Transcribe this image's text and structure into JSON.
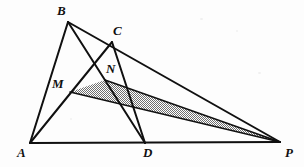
{
  "figure": {
    "kind": "geometry-diagram",
    "background_color": "#fdfdfd",
    "stroke_color": "#101010",
    "shade_fill_color": "#9a9a9a",
    "canvas": {
      "width": 304,
      "height": 167
    },
    "points": [
      {
        "id": "A",
        "label": "A",
        "x": 30,
        "y": 143,
        "label_x": 17,
        "label_y": 146
      },
      {
        "id": "B",
        "label": "B",
        "x": 68,
        "y": 22,
        "label_x": 57,
        "label_y": 4
      },
      {
        "id": "C",
        "label": "C",
        "x": 112,
        "y": 42,
        "label_x": 113,
        "label_y": 24
      },
      {
        "id": "D",
        "label": "D",
        "x": 145,
        "y": 143,
        "label_x": 143,
        "label_y": 146
      },
      {
        "id": "M",
        "label": "M",
        "x": 70,
        "y": 92,
        "label_x": 52,
        "label_y": 77
      },
      {
        "id": "N",
        "label": "N",
        "x": 105,
        "y": 80,
        "label_x": 106,
        "label_y": 62
      },
      {
        "id": "P",
        "label": "P",
        "x": 280,
        "y": 142,
        "label_x": 285,
        "label_y": 146
      }
    ],
    "segments": [
      {
        "name": "segment-A-B",
        "from": "A",
        "to": "B",
        "width": 2.0
      },
      {
        "name": "segment-A-P",
        "from": "A",
        "to": "P",
        "width": 2.0
      },
      {
        "name": "segment-B-P",
        "from": "B",
        "to": "P",
        "width": 2.0
      },
      {
        "name": "segment-B-D",
        "from": "B",
        "to": "D",
        "width": 2.0
      },
      {
        "name": "segment-A-C",
        "from": "A",
        "to": "C",
        "width": 2.0
      },
      {
        "name": "segment-C-D",
        "from": "C",
        "to": "D",
        "width": 2.0
      },
      {
        "name": "segment-M-P",
        "from": "M",
        "to": "P",
        "width": 1.6
      },
      {
        "name": "segment-N-P",
        "from": "N",
        "to": "P",
        "width": 1.6
      }
    ],
    "shaded_region": {
      "name": "shaded-triangle-MNP",
      "vertices": [
        "M",
        "N",
        "P"
      ],
      "fill": "#9a9a9a"
    }
  }
}
